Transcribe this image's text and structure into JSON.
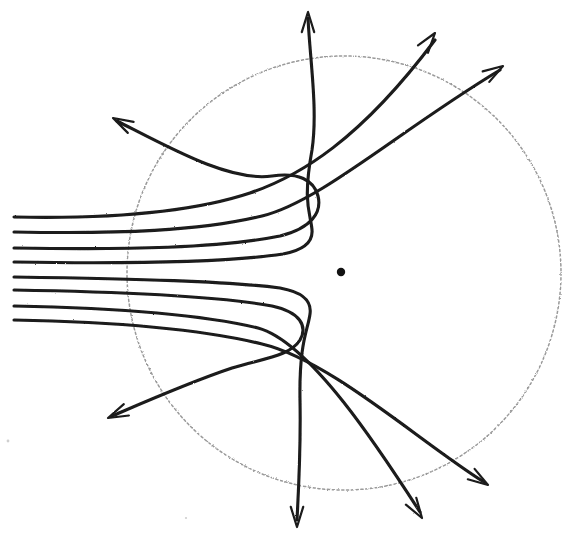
{
  "figure": {
    "medium": "hand-drawn pencil sketch",
    "background_color": "#ffffff",
    "ink_color": "#1a1a1a",
    "faint_ink_color": "#9a9a9a",
    "width": 568,
    "height": 545
  },
  "nucleus": {
    "label": "nucleus",
    "cx": 341,
    "cy": 272,
    "r": 4.2,
    "color": "#121212"
  },
  "boundary": {
    "label": "field-boundary-circle",
    "style": "dotted",
    "cx": 344,
    "cy": 273,
    "r": 217,
    "color": "#9a9a9a"
  },
  "incoming_beam": {
    "label": "incident parallel beam",
    "direction": "left-to-right",
    "count": 8,
    "entry_y": [
      217,
      232,
      248,
      262,
      277,
      290,
      306,
      320
    ]
  },
  "trajectories": [
    {
      "id": "t1",
      "name": "trajectory-small-deflection-upper",
      "impact_parameter_rank": 1,
      "deflection": "slight upward bend",
      "exit_direction": "upper-right",
      "d": "M 14 217 C 110 219 190 213 250 193 C 300 176 360 140 435 40",
      "arrow_at": [
        435,
        33
      ],
      "arrow_angle": -53
    },
    {
      "id": "t2",
      "name": "trajectory-moderate-deflection-upper",
      "impact_parameter_rank": 2,
      "deflection": "moderate upward bend",
      "exit_direction": "upper-right shallow",
      "d": "M 14 232 C 120 234 200 231 262 216 C 320 202 400 130 500 70",
      "arrow_at": [
        503,
        66
      ],
      "arrow_angle": -32
    },
    {
      "id": "t3",
      "name": "trajectory-hairpin-upper-outer",
      "impact_parameter_rank": 3,
      "deflection": "large back-scatter hairpin",
      "exit_direction": "upper-left back-scatter",
      "d": "M 14 248 C 130 250 220 248 280 236 C 312 228 322 212 318 196 C 314 180 298 172 272 176 C 230 182 170 148 117 121",
      "arrow_at": [
        113,
        118
      ],
      "arrow_angle": 208
    },
    {
      "id": "t4",
      "name": "trajectory-hairpin-upper-inner",
      "impact_parameter_rank": 4,
      "deflection": "near head-on hairpin, back up",
      "exit_direction": "straight up",
      "d": "M 14 262 C 140 264 230 262 283 254 C 304 250 313 242 312 230 C 311 214 302 205 312 150 C 318 110 310 60 308 18",
      "arrow_at": [
        308,
        12
      ],
      "arrow_angle": -90
    },
    {
      "id": "t5",
      "name": "trajectory-hairpin-lower-inner",
      "impact_parameter_rank": 5,
      "deflection": "near head-on hairpin, back down",
      "exit_direction": "straight down",
      "d": "M 14 277 C 140 279 225 281 280 288 C 302 292 312 300 310 314 C 308 330 299 342 300 400 C 301 450 298 500 297 520",
      "arrow_at": [
        297,
        527
      ],
      "arrow_angle": 90
    },
    {
      "id": "t6",
      "name": "trajectory-hairpin-lower-outer",
      "impact_parameter_rank": 6,
      "deflection": "large back-scatter hairpin downward",
      "exit_direction": "lower-left back-scatter",
      "d": "M 14 290 C 130 292 218 296 272 306 C 300 312 308 326 300 340 C 290 356 265 358 232 368 C 190 382 140 404 112 416",
      "arrow_at": [
        108,
        418
      ],
      "arrow_angle": 156
    },
    {
      "id": "t7",
      "name": "trajectory-moderate-deflection-lower",
      "impact_parameter_rank": 7,
      "deflection": "moderate downward bend",
      "exit_direction": "lower-right steep",
      "d": "M 14 306 C 120 308 200 314 258 328 C 310 342 380 450 420 512",
      "arrow_at": [
        422,
        518
      ],
      "arrow_angle": 57
    },
    {
      "id": "t8",
      "name": "trajectory-small-deflection-lower",
      "impact_parameter_rank": 8,
      "deflection": "slight downward bend",
      "exit_direction": "lower-right shallow",
      "d": "M 14 320 C 120 322 205 330 262 344 C 330 360 420 442 484 482",
      "arrow_at": [
        488,
        485
      ],
      "arrow_angle": 33
    }
  ],
  "specks": [
    {
      "x": 8,
      "y": 441,
      "r": 1.4
    },
    {
      "x": 186,
      "y": 518,
      "r": 1.1
    }
  ]
}
